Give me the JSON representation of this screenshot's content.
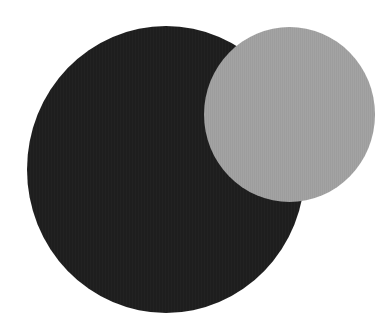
{
  "figure": {
    "background_color": "#ffffff",
    "shapes": [
      {
        "name": "large-dark-circle",
        "type": "circle",
        "color": "#1e1e1e",
        "center": [
          166,
          170
        ],
        "size": [
          278,
          287
        ]
      },
      {
        "name": "small-gray-circle",
        "type": "circle",
        "color": "#a3a3a3",
        "center": [
          289,
          114
        ],
        "size": [
          171,
          175
        ],
        "layer": "front"
      }
    ]
  }
}
